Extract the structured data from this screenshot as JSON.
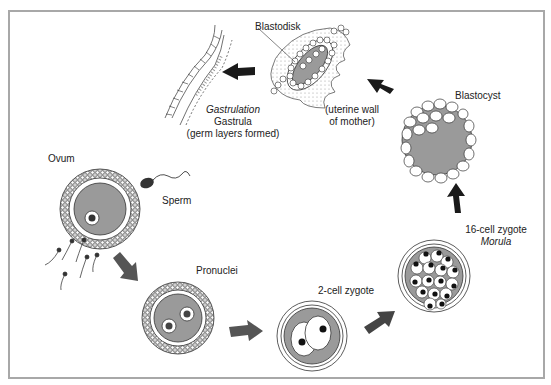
{
  "diagram": {
    "type": "biological-cycle",
    "colors": {
      "frame": "#a8a8a8",
      "cytoplasm": "#9a9a9a",
      "arrow_dark": "#1a1a1a",
      "arrow_gray": "#555555"
    },
    "stages": {
      "ovum": {
        "label": "Ovum"
      },
      "sperm": {
        "label": "Sperm"
      },
      "pronuclei": {
        "label": "Pronuclei"
      },
      "two_cell": {
        "label": "2-cell zygote"
      },
      "morula": {
        "label": "16-cell zygote",
        "label_italic": "Morula"
      },
      "blastocyst": {
        "label": "Blastocyst"
      },
      "blastodisk": {
        "label": "Blastodisk",
        "note_line1": "(uterine wall",
        "note_line2": "of mother)"
      },
      "gastrula": {
        "label_italic": "Gastrulation",
        "label": "Gastrula",
        "note": "(germ layers formed)"
      }
    },
    "arrows": [
      {
        "from": "ovum",
        "to": "pronuclei"
      },
      {
        "from": "pronuclei",
        "to": "two_cell"
      },
      {
        "from": "two_cell",
        "to": "morula"
      },
      {
        "from": "morula",
        "to": "blastocyst"
      },
      {
        "from": "blastocyst",
        "to": "blastodisk"
      },
      {
        "from": "blastodisk",
        "to": "gastrula"
      }
    ]
  }
}
